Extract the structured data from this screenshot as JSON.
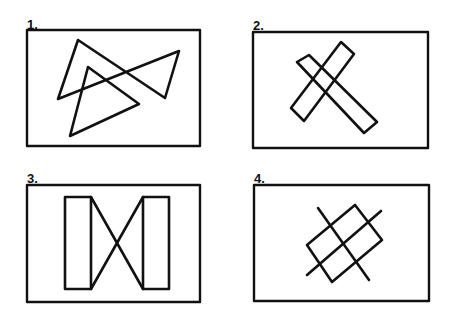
{
  "panels": [
    {
      "label": "1.",
      "description": "two overlapping triangles"
    },
    {
      "label": "2.",
      "description": "two crossing rectangular bars forming an X"
    },
    {
      "label": "3.",
      "description": "two vertical rectangles joined by crossing diagonals"
    },
    {
      "label": "4.",
      "description": "tilted rectangle bisected by two crossing lines"
    }
  ],
  "colors": {
    "stroke": "#111111",
    "background": "#ffffff"
  }
}
